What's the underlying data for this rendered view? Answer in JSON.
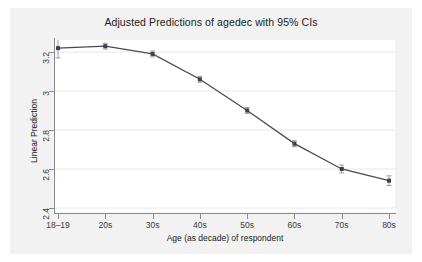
{
  "chart_data": {
    "type": "line",
    "title": "Adjusted Predictions of agedec with 95% CIs",
    "xlabel": "Age (as decade) of respondent",
    "ylabel": "Linear Prediction",
    "categories": [
      "18–19",
      "20s",
      "30s",
      "40s",
      "50s",
      "60s",
      "70s",
      "80s"
    ],
    "values": [
      3.22,
      3.23,
      3.19,
      3.06,
      2.9,
      2.73,
      2.6,
      2.54
    ],
    "ci_lower": [
      3.17,
      3.215,
      3.175,
      3.045,
      2.885,
      2.715,
      2.58,
      2.515
    ],
    "ci_upper": [
      3.275,
      3.245,
      3.205,
      3.075,
      2.915,
      2.745,
      2.62,
      2.565
    ],
    "ylim": [
      2.4,
      3.3
    ],
    "yticks": [
      2.4,
      2.6,
      2.8,
      3.0,
      3.2
    ],
    "ytick_labels": [
      "2.4",
      "2.6",
      "2.8",
      "3",
      "3.2"
    ],
    "grid": true,
    "grid_axis": "y",
    "legend": "none",
    "series_name": "Linear Prediction",
    "marker": "square",
    "error_bars": "95% CI",
    "line_color": "#4a4a57",
    "marker_color": "#3f3f4c",
    "grid_color": "#e8e8ec",
    "plot_background": "#ffffff",
    "figure_background": "#f2f2f2"
  }
}
